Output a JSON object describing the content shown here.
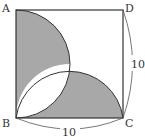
{
  "diagram": {
    "vertices": {
      "A": "A",
      "B": "B",
      "C": "C",
      "D": "D"
    },
    "measurements": {
      "right_side": "10",
      "bottom_side": "10"
    },
    "colors": {
      "shade": "#a8a8a8",
      "stroke": "#333333",
      "background": "#ffffff"
    }
  }
}
